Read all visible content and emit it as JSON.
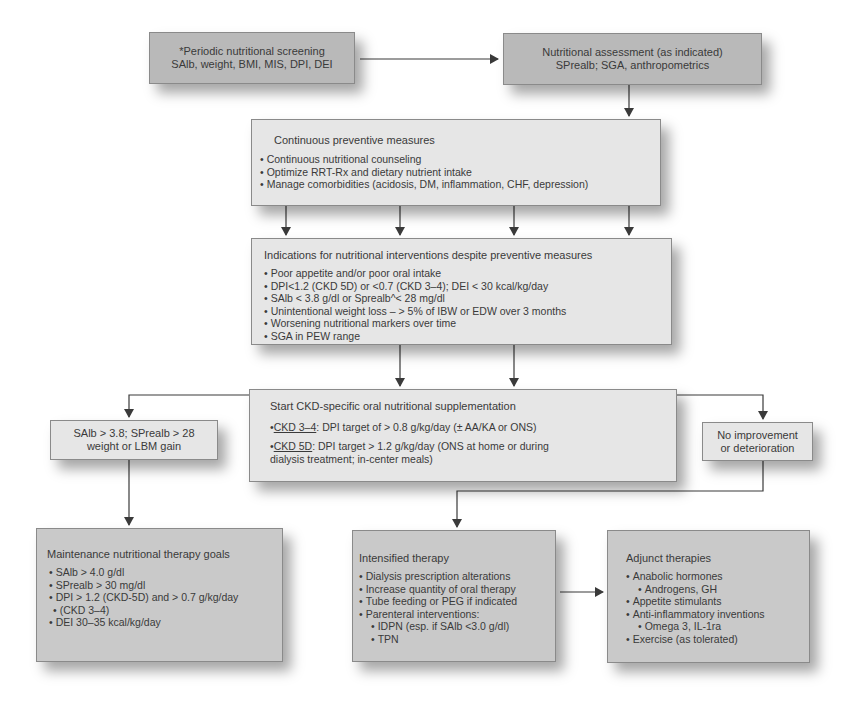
{
  "screening": {
    "line1": "*Periodic nutritional screening",
    "line2": "SAlb, weight, BMI, MIS, DPI, DEI"
  },
  "assessment": {
    "line1": "Nutritional assessment (as indicated)",
    "line2": "SPrealb; SGA, anthropometrics"
  },
  "preventive": {
    "title": "Continuous preventive measures",
    "items": [
      "Continuous nutritional counseling",
      "Optimize RRT-Rx and dietary nutrient intake",
      "Manage comorbidities (acidosis, DM, inflammation, CHF, depression)"
    ]
  },
  "indications": {
    "title": "Indications for nutritional interventions despite preventive measures",
    "items": [
      "Poor appetite and/or poor oral intake",
      "DPI<1.2 (CKD 5D) or <0.7 (CKD 3–4); DEI < 30 kcal/kg/day",
      "SAlb < 3.8 g/dl or Sprealb^< 28 mg/dl",
      "Unintentional weight loss – > 5% of IBW or EDW over 3 months",
      "Worsening nutritional markers over time",
      "SGA in PEW range"
    ]
  },
  "supplementation": {
    "title": "Start CKD-specific oral nutritional supplementation",
    "item1_label": "CKD 3–4",
    "item1_text": ": DPI target of > 0.8 g/kg/day (± AA/KA or ONS)",
    "item2_label": "CKD 5D",
    "item2_text": ": DPI target > 1.2 g/kg/day (ONS at home or during",
    "item2_cont": "dialysis treatment; in-center meals)"
  },
  "improvement": {
    "line1": "SAlb > 3.8; SPrealb > 28",
    "line2": "weight or LBM gain"
  },
  "no_improvement": {
    "line1": "No improvement",
    "line2": "or deterioration"
  },
  "maintenance": {
    "title": "Maintenance nutritional therapy goals",
    "items": [
      "SAlb > 4.0 g/dl",
      "SPrealb > 30 mg/dl",
      "DPI > 1.2 (CKD-5D) and > 0.7 g/kg/day",
      "DEI 30–35 kcal/kg/day"
    ],
    "item3_cont": "(CKD 3–4)"
  },
  "intensified": {
    "title": "Intensified therapy",
    "items": [
      "Dialysis prescription alterations",
      "Increase quantity of oral therapy",
      "Tube feeding or PEG if indicated",
      "Parenteral interventions:"
    ],
    "subitems": [
      "IDPN (esp. if SAlb <3.0 g/dl)",
      "TPN"
    ]
  },
  "adjunct": {
    "title": "Adjunct therapies",
    "items": [
      "Anabolic hormones",
      "Androgens, GH",
      "Appetite stimulants",
      "Anti-inflammatory inventions",
      "Omega 3, IL-1ra",
      "Exercise (as tolerated)"
    ]
  },
  "colors": {
    "dark_box": "#b9b9b9",
    "mid_box": "#c9c9c9",
    "light_box": "#e6e6e6",
    "line": "#3a3a3a"
  }
}
